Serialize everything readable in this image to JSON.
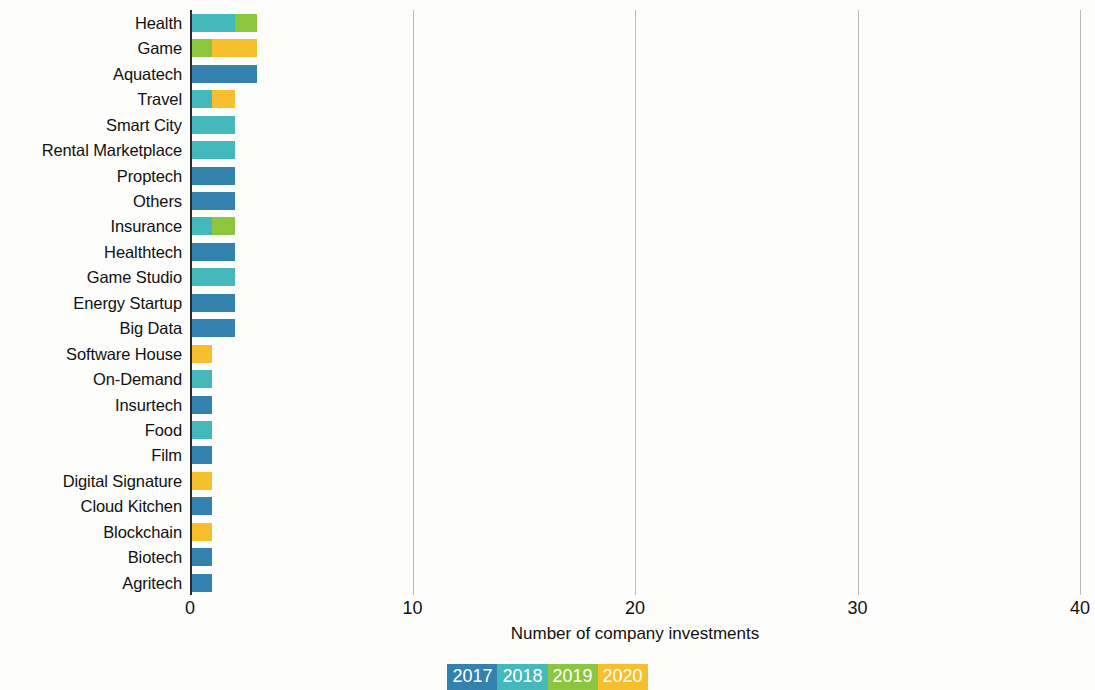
{
  "chart_data": {
    "type": "bar",
    "orientation": "horizontal",
    "stacked": true,
    "title": "",
    "xlabel": "Number of company investments",
    "ylabel": "",
    "xlim": [
      0,
      40
    ],
    "xticks": [
      0,
      10,
      20,
      30,
      40
    ],
    "grid": true,
    "legend_position": "bottom",
    "categories": [
      "Health",
      "Game",
      "Aquatech",
      "Travel",
      "Smart City",
      "Rental Marketplace",
      "Proptech",
      "Others",
      "Insurance",
      "Healthtech",
      "Game Studio",
      "Energy Startup",
      "Big Data",
      "Software House",
      "On-Demand",
      "Insurtech",
      "Food",
      "Film",
      "Digital Signature",
      "Cloud Kitchen",
      "Blockchain",
      "Biotech",
      "Agritech"
    ],
    "series": [
      {
        "name": "2017",
        "color": "#3382ad",
        "values": [
          0,
          0,
          3,
          0,
          0,
          0,
          2,
          2,
          0,
          2,
          0,
          2,
          2,
          0,
          0,
          1,
          0,
          1,
          0,
          1,
          0,
          1,
          1
        ]
      },
      {
        "name": "2018",
        "color": "#45b8bc",
        "values": [
          2,
          0,
          0,
          1,
          2,
          2,
          0,
          0,
          1,
          0,
          2,
          0,
          0,
          0,
          1,
          0,
          1,
          0,
          0,
          0,
          0,
          0,
          0
        ]
      },
      {
        "name": "2019",
        "color": "#8cc63e",
        "values": [
          1,
          1,
          0,
          0,
          0,
          0,
          0,
          0,
          1,
          0,
          0,
          0,
          0,
          0,
          0,
          0,
          0,
          0,
          0,
          0,
          0,
          0,
          0
        ]
      },
      {
        "name": "2020",
        "color": "#f6c02c",
        "values": [
          0,
          2,
          0,
          1,
          0,
          0,
          0,
          0,
          0,
          0,
          0,
          0,
          0,
          1,
          0,
          0,
          0,
          0,
          1,
          0,
          1,
          0,
          0
        ]
      }
    ],
    "totals": [
      3,
      3,
      3,
      2,
      2,
      2,
      2,
      2,
      2,
      2,
      2,
      2,
      2,
      1,
      1,
      1,
      1,
      1,
      1,
      1,
      1,
      1,
      1
    ]
  },
  "legend": {
    "entries": [
      {
        "label": "2017",
        "color": "#3382ad"
      },
      {
        "label": "2018",
        "color": "#45b8bc"
      },
      {
        "label": "2019",
        "color": "#8cc63e"
      },
      {
        "label": "2020",
        "color": "#f6c02c"
      }
    ]
  }
}
